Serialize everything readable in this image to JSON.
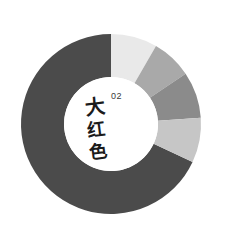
{
  "chart_data": {
    "type": "pie",
    "title": "",
    "subtitle": "",
    "xlabel": "",
    "ylabel": "",
    "variant": "donut",
    "center_x": 111,
    "center_y": 124,
    "outer_radius": 90,
    "inner_radius": 47,
    "start_angle_deg": 0,
    "direction": "counter-clockwise",
    "background": "#ffffff",
    "grid": false,
    "legend": "none",
    "gap_deg": 14,
    "categories": [
      "Segment 1",
      "Segment 2",
      "Segment 3",
      "Segment 4",
      "Segment 5"
    ],
    "values": [
      68.1,
      8.3,
      7.2,
      8.3,
      8.1
    ],
    "angles_deg": [
      245,
      30,
      26,
      30,
      29
    ],
    "colors": [
      "#4b4b4b",
      "#e9e9e9",
      "#a9a9a9",
      "#8b8b8b",
      "#c6c6c6"
    ],
    "series": [
      {
        "name": "Color proportions",
        "values": [
          68.1,
          8.3,
          7.2,
          8.3,
          8.1
        ]
      }
    ],
    "annotations": [
      {
        "text": "02",
        "role": "index-number",
        "position": "center-top"
      },
      {
        "text": "大红色",
        "role": "center-title",
        "position": "center"
      }
    ]
  },
  "center": {
    "number": "02",
    "title_chars": [
      "大",
      "红",
      "色"
    ],
    "title_full": "大红色"
  },
  "colors": {
    "background": "#ffffff",
    "primary_segment": "#4b4b4b",
    "text": "#1b1b1b",
    "number_text": "#3a3a3a"
  }
}
